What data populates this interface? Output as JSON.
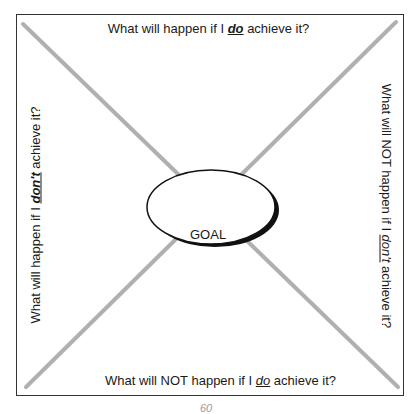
{
  "diagram": {
    "type": "goal-quadrant-worksheet",
    "center": {
      "label": "GOAL"
    },
    "prompts": {
      "top": {
        "before": "What will happen if I ",
        "emphasis": "do",
        "after": " achieve it?"
      },
      "left": {
        "before": "What will happen if I ",
        "emphasis": "don't",
        "after": " achieve it?"
      },
      "right": {
        "before": "What will NOT happen if I ",
        "emphasis": "don't",
        "after": " achieve it?"
      },
      "bottom": {
        "before": "What will NOT happen if I ",
        "emphasis": "do",
        "after": " achieve it?"
      }
    },
    "colors": {
      "border": "#333333",
      "diagonals": "#b0b0b0",
      "ellipse_fill": "#ffffff",
      "ellipse_stroke": "#111111",
      "text": "#1a1a1a"
    }
  },
  "page": {
    "number": "60"
  }
}
